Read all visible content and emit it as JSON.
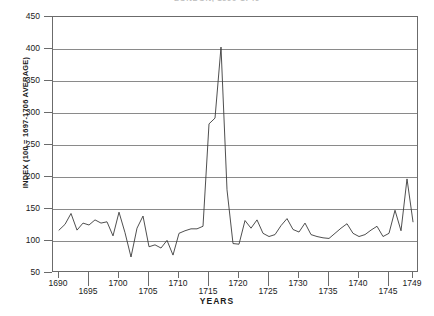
{
  "chart_data": {
    "type": "line",
    "title": "LONDON, 1690-1749",
    "xlabel": "YEARS",
    "ylabel": "INDEX (100 = 1697-1706 AVERAGE)",
    "xlim": [
      1689,
      1750
    ],
    "ylim": [
      50,
      450
    ],
    "ytick_values": [
      50,
      100,
      150,
      200,
      250,
      300,
      350,
      400,
      450
    ],
    "ytick_labels": [
      "50",
      "100",
      "150",
      "200",
      "250",
      "300",
      "350",
      "400",
      "450"
    ],
    "xtick_values": [
      1690,
      1695,
      1700,
      1705,
      1710,
      1715,
      1720,
      1725,
      1730,
      1735,
      1740,
      1745,
      1749
    ],
    "xtick_labels": [
      "1690",
      "1695",
      "1700",
      "1705",
      "1710",
      "1715",
      "1720",
      "1725",
      "1730",
      "1735",
      "1740",
      "1745",
      "1749"
    ],
    "grid": "horizontal",
    "legend": "none",
    "series": [
      {
        "name": "Index",
        "x": [
          1690,
          1691,
          1692,
          1693,
          1694,
          1695,
          1696,
          1697,
          1698,
          1699,
          1700,
          1701,
          1702,
          1703,
          1704,
          1705,
          1706,
          1707,
          1708,
          1709,
          1710,
          1711,
          1712,
          1713,
          1714,
          1715,
          1716,
          1717,
          1718,
          1719,
          1720,
          1721,
          1722,
          1723,
          1724,
          1725,
          1726,
          1727,
          1728,
          1729,
          1730,
          1731,
          1732,
          1733,
          1734,
          1735,
          1736,
          1737,
          1738,
          1739,
          1740,
          1741,
          1742,
          1743,
          1744,
          1745,
          1746,
          1747,
          1748,
          1749
        ],
        "values": [
          117,
          126,
          143,
          117,
          128,
          125,
          133,
          128,
          130,
          108,
          145,
          113,
          75,
          120,
          139,
          91,
          94,
          89,
          101,
          78,
          112,
          116,
          119,
          119,
          123,
          283,
          292,
          403,
          180,
          96,
          95,
          132,
          120,
          133,
          112,
          107,
          110,
          124,
          135,
          118,
          114,
          128,
          110,
          107,
          105,
          104,
          112,
          120,
          127,
          112,
          107,
          110,
          117,
          123,
          107,
          112,
          148,
          116,
          197,
          130
        ]
      }
    ]
  }
}
